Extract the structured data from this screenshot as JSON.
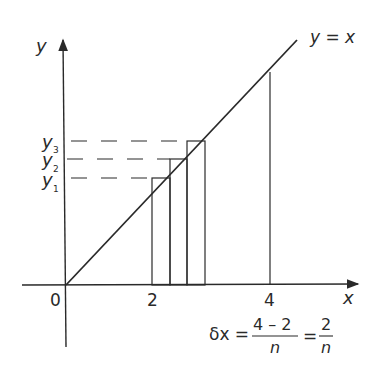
{
  "diagram": {
    "axis_labels": {
      "x": "x",
      "y": "y"
    },
    "line_label": "y = x",
    "origin_label": "0",
    "x_ticks": [
      "2",
      "4"
    ],
    "y_labels": [
      {
        "base": "y",
        "sub": "1"
      },
      {
        "base": "y",
        "sub": "2"
      },
      {
        "base": "y",
        "sub": "3"
      }
    ],
    "formula": {
      "lhs": "δx =",
      "frac1_num": "4 – 2",
      "frac1_den": "n",
      "eq": "=",
      "frac2_num": "2",
      "frac2_den": "n"
    },
    "colors": {
      "ink": "#2a2a2a",
      "background": "#ffffff"
    }
  }
}
